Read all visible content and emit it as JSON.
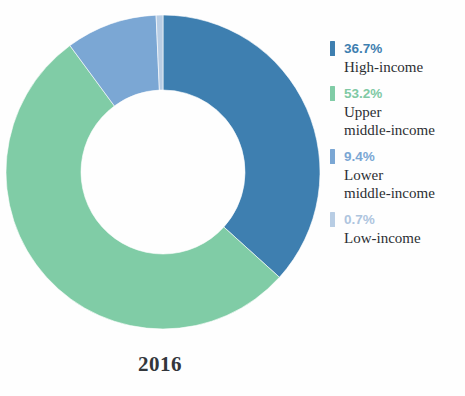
{
  "chart_data": {
    "type": "pie",
    "variant": "donut",
    "title": "",
    "caption": "2016",
    "categories": [
      "High-income",
      "Upper middle-income",
      "Lower middle-income",
      "Low-income"
    ],
    "values": [
      36.7,
      53.2,
      9.4,
      0.7
    ],
    "value_labels": [
      "36.7%",
      "53.2%",
      "9.4%",
      "0.7%"
    ],
    "unit": "%",
    "total": 100.0,
    "start_angle_deg": 0,
    "direction": "clockwise",
    "inner_radius_ratio": 0.52,
    "legend_position": "right",
    "grid": false,
    "colors": [
      "#3e7fb0",
      "#80cca6",
      "#7ba7d4",
      "#b8cde4"
    ],
    "series": [
      {
        "name": "Share of population by income group",
        "values": [
          36.7,
          53.2,
          9.4,
          0.7
        ]
      }
    ]
  },
  "donut": {
    "segments": [
      {
        "key": "high-income",
        "label": "High-income",
        "percent_label": "36.7%",
        "value": 36.7,
        "color": "#3e7fb0"
      },
      {
        "key": "upper-middle-income",
        "label": "Upper\nmiddle-income",
        "percent_label": "53.2%",
        "value": 53.2,
        "color": "#80cca6"
      },
      {
        "key": "lower-middle-income",
        "label": "Lower\nmiddle-income",
        "percent_label": "9.4%",
        "value": 9.4,
        "color": "#7ba7d4"
      },
      {
        "key": "low-income",
        "label": "Low-income",
        "percent_label": "0.7%",
        "value": 0.7,
        "color": "#b8cde4"
      }
    ]
  },
  "legend": {
    "entries": [
      {
        "percent": "36.7%",
        "label": "High-income",
        "color": "#3e7fb0",
        "pct_color": "#3e7fb0"
      },
      {
        "percent": "53.2%",
        "label": "Upper\nmiddle-income",
        "color": "#80cca6",
        "pct_color": "#7fc9a4"
      },
      {
        "percent": "9.4%",
        "label": "Lower\nmiddle-income",
        "color": "#7ba7d4",
        "pct_color": "#7ba7d4"
      },
      {
        "percent": "0.7%",
        "label": "Low-income",
        "color": "#b8cde4",
        "pct_color": "#aec5de"
      }
    ]
  },
  "caption": {
    "year": "2016"
  }
}
